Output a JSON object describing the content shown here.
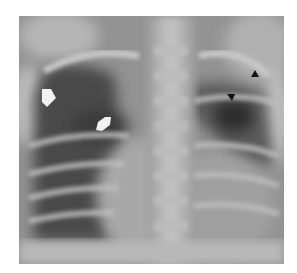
{
  "image": {
    "subject": "Frontal chest radiograph",
    "colors": {
      "background": "#ffffff",
      "film_mid": "#8e8e8e",
      "lung_dark": "#3a3a3a",
      "bone_light": "#d4d4d4",
      "arrow_white": "#f2f2f2",
      "arrowhead_black": "#111111"
    },
    "annotations": [
      {
        "type": "white-arrow",
        "label": "right upper zone arrow"
      },
      {
        "type": "white-arrow",
        "label": "right hilar arrow"
      },
      {
        "type": "black-arrowhead",
        "label": "left apical arrowhead"
      },
      {
        "type": "black-arrowhead",
        "label": "left upper zone arrowhead"
      }
    ]
  }
}
